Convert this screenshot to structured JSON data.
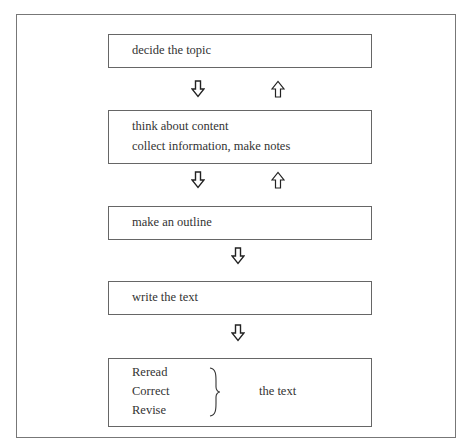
{
  "diagram": {
    "type": "flowchart",
    "steps": [
      {
        "lines": [
          "decide the topic"
        ]
      },
      {
        "lines": [
          "think about content",
          "collect information, make notes"
        ]
      },
      {
        "lines": [
          "make an outline"
        ]
      },
      {
        "lines": [
          "write the text"
        ]
      },
      {
        "lines": [
          "Reread",
          "Correct",
          "Revise"
        ],
        "brace_label": "the text"
      }
    ],
    "arrows": [
      {
        "from": 0,
        "to": 1,
        "direction": "down"
      },
      {
        "from": 1,
        "to": 0,
        "direction": "up"
      },
      {
        "from": 1,
        "to": 2,
        "direction": "down"
      },
      {
        "from": 2,
        "to": 1,
        "direction": "up"
      },
      {
        "from": 2,
        "to": 3,
        "direction": "down"
      },
      {
        "from": 3,
        "to": 4,
        "direction": "down"
      }
    ]
  }
}
